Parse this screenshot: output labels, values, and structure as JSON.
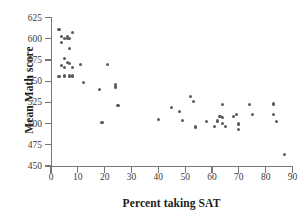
{
  "chart_data": {
    "type": "scatter",
    "title": "",
    "xlabel": "Percent taking SAT",
    "ylabel": "Mean Math score",
    "xlim": [
      0,
      90
    ],
    "ylim": [
      450,
      625
    ],
    "xticks": [
      0,
      10,
      20,
      30,
      40,
      50,
      60,
      70,
      80,
      90
    ],
    "yticks": [
      450,
      475,
      500,
      525,
      550,
      575,
      600,
      625
    ],
    "grid": false,
    "legend": null,
    "marker_color": "#5a5a5a",
    "axis_color": "#767676",
    "points": [
      {
        "x": 3,
        "y": 611
      },
      {
        "x": 4,
        "y": 603
      },
      {
        "x": 4,
        "y": 596
      },
      {
        "x": 5,
        "y": 600
      },
      {
        "x": 6,
        "y": 600
      },
      {
        "x": 6,
        "y": 603
      },
      {
        "x": 7,
        "y": 600
      },
      {
        "x": 8,
        "y": 607
      },
      {
        "x": 7,
        "y": 588
      },
      {
        "x": 5,
        "y": 577
      },
      {
        "x": 6,
        "y": 572
      },
      {
        "x": 4,
        "y": 568
      },
      {
        "x": 5,
        "y": 566
      },
      {
        "x": 7,
        "y": 571
      },
      {
        "x": 8,
        "y": 566
      },
      {
        "x": 11,
        "y": 570
      },
      {
        "x": 3,
        "y": 555
      },
      {
        "x": 5,
        "y": 556
      },
      {
        "x": 7,
        "y": 556
      },
      {
        "x": 8,
        "y": 556
      },
      {
        "x": 12,
        "y": 548
      },
      {
        "x": 18,
        "y": 540
      },
      {
        "x": 21,
        "y": 570
      },
      {
        "x": 24,
        "y": 546
      },
      {
        "x": 24,
        "y": 543
      },
      {
        "x": 25,
        "y": 521
      },
      {
        "x": 19,
        "y": 501
      },
      {
        "x": 40,
        "y": 505
      },
      {
        "x": 45,
        "y": 519
      },
      {
        "x": 48,
        "y": 514
      },
      {
        "x": 49,
        "y": 504
      },
      {
        "x": 52,
        "y": 532
      },
      {
        "x": 53,
        "y": 526
      },
      {
        "x": 54,
        "y": 496
      },
      {
        "x": 58,
        "y": 502
      },
      {
        "x": 61,
        "y": 497
      },
      {
        "x": 62,
        "y": 503
      },
      {
        "x": 63,
        "y": 508
      },
      {
        "x": 64,
        "y": 507
      },
      {
        "x": 64,
        "y": 522
      },
      {
        "x": 64,
        "y": 500
      },
      {
        "x": 65,
        "y": 497
      },
      {
        "x": 68,
        "y": 508
      },
      {
        "x": 69,
        "y": 511
      },
      {
        "x": 70,
        "y": 500
      },
      {
        "x": 70,
        "y": 499
      },
      {
        "x": 70,
        "y": 493
      },
      {
        "x": 74,
        "y": 522
      },
      {
        "x": 75,
        "y": 511
      },
      {
        "x": 83,
        "y": 523
      },
      {
        "x": 83,
        "y": 511
      },
      {
        "x": 84,
        "y": 502
      },
      {
        "x": 87,
        "y": 464
      }
    ]
  }
}
